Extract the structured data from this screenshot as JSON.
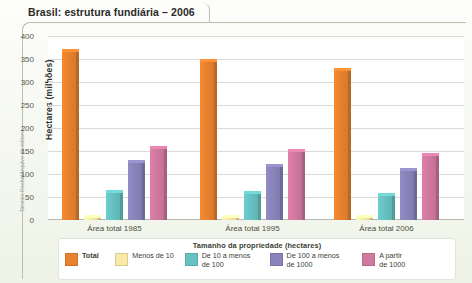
{
  "credit": "Tarcisio Rocha/Arquivo da editora",
  "chart_data": {
    "type": "bar",
    "title": "Brasil: estrutura fundiária – 2006",
    "xlabel": "",
    "ylabel": "Hectares (milhões)",
    "ylim": [
      0,
      400
    ],
    "yticks": [
      0,
      50,
      100,
      150,
      200,
      250,
      300,
      350,
      400
    ],
    "grid": true,
    "legend_position": "bottom",
    "legend_title": "Tamanho da propriedade (hectares)",
    "categories": [
      "Área total 1985",
      "Área total 1995",
      "Área total 2006"
    ],
    "series": [
      {
        "name": "Total",
        "color": "#e8822e",
        "values": [
          372,
          351,
          330
        ]
      },
      {
        "name": "Menos de 10",
        "color": "#f7e9a8",
        "values": [
          10,
          10,
          10
        ]
      },
      {
        "name": "De 10 a menos\nde 100",
        "color": "#67c2c2",
        "values": [
          65,
          62,
          59
        ]
      },
      {
        "name": "De 100 a menos\nde 1000",
        "color": "#8a84bb",
        "values": [
          131,
          122,
          112
        ]
      },
      {
        "name": "A partir\nde 1000",
        "color": "#d179a0",
        "values": [
          160,
          155,
          146
        ]
      }
    ]
  }
}
